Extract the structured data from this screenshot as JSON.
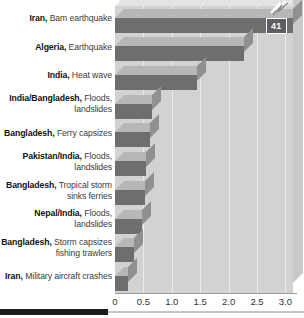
{
  "chart_data": {
    "type": "bar",
    "orientation": "horizontal",
    "title": "",
    "xlabel": "",
    "ylabel": "",
    "xlim": [
      0,
      3.2
    ],
    "xticks": [
      0,
      0.5,
      1.0,
      1.5,
      2.0,
      2.5,
      3.0
    ],
    "xtick_labels": [
      "0",
      "0.5",
      "1.0",
      "1.5",
      "2.0",
      "2.5",
      "3.0"
    ],
    "grid": true,
    "legend": null,
    "axis_broken": true,
    "break_note": "Top bar extends past axis; true value shown in callout",
    "categories": [
      "Iran, Bam earthquake",
      "Algeria, Earthquake",
      "India, Heat wave",
      "India/Bangladesh, Floods, landslides",
      "Bangladesh, Ferry capsizes",
      "Pakistan/India, Floods, landslides",
      "Bangladesh, Tropical storm sinks ferries",
      "Nepal/India, Floods, landslides",
      "Bangladesh, Storm capsizes fishing trawlers",
      "Iran, Military aircraft crashes"
    ],
    "values": [
      41,
      2.27,
      1.45,
      0.65,
      0.62,
      0.54,
      0.52,
      0.48,
      0.33,
      0.23
    ],
    "data_labels": [
      "41",
      "",
      "",
      "",
      "",
      "",
      "",
      "",
      "",
      ""
    ],
    "colors": {
      "bar_front": "#6e6e6e",
      "bar_top": "#b7b7b7",
      "bar_side": "#909090",
      "panel": "#d2d2d2",
      "gridline": "#ebebeb",
      "callout_bg": "#5e5e5e",
      "callout_text": "#ffffff"
    }
  },
  "rows": [
    {
      "lead": "Iran,",
      "detail": "Bam earthquake",
      "value": 41,
      "plotted": 3.2,
      "label": "41"
    },
    {
      "lead": "Algeria,",
      "detail": "Earthquake",
      "value": 2.27,
      "plotted": 2.27,
      "label": ""
    },
    {
      "lead": "India,",
      "detail": "Heat wave",
      "value": 1.45,
      "plotted": 1.45,
      "label": ""
    },
    {
      "lead": "India/Bangladesh,",
      "detail": "Floods, landslides",
      "value": 0.65,
      "plotted": 0.65,
      "label": ""
    },
    {
      "lead": "Bangladesh,",
      "detail": "Ferry capsizes",
      "value": 0.62,
      "plotted": 0.62,
      "label": ""
    },
    {
      "lead": "Pakistan/India,",
      "detail": "Floods, landslides",
      "value": 0.54,
      "plotted": 0.54,
      "label": ""
    },
    {
      "lead": "Bangladesh,",
      "detail": "Tropical storm sinks ferries",
      "value": 0.52,
      "plotted": 0.52,
      "label": "",
      "inline": true
    },
    {
      "lead": "Nepal/India,",
      "detail": "Floods, landslides",
      "value": 0.48,
      "plotted": 0.48,
      "label": ""
    },
    {
      "lead": "Bangladesh,",
      "detail": "Storm capsizes fishing trawlers",
      "value": 0.33,
      "plotted": 0.33,
      "label": "",
      "inline": true
    },
    {
      "lead": "Iran,",
      "detail": "Military aircraft crashes",
      "value": 0.23,
      "plotted": 0.23,
      "label": "",
      "inline": true
    }
  ],
  "axis": {
    "ticks": [
      "0",
      "0.5",
      "1.0",
      "1.5",
      "2.0",
      "2.5",
      "3.0"
    ]
  }
}
